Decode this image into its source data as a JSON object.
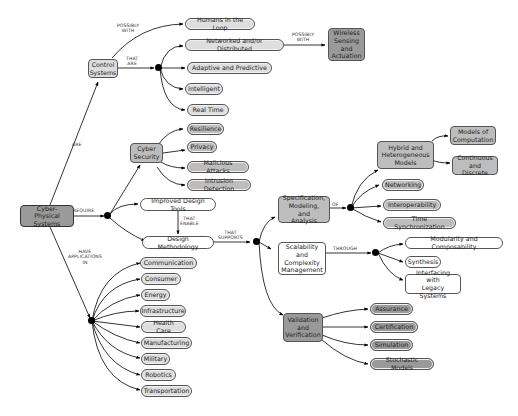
{
  "diagram": {
    "type": "concept-map",
    "root": {
      "label": "Cyber-Physical\nSystems"
    },
    "link_labels": {
      "are": "ARE",
      "require": "REQUIRE",
      "have_applications_in": "HAVE\nAPPLICATIONS\nIN",
      "possibly_with_1": "POSSIBLY\nWITH",
      "that_are": "THAT\nARE",
      "possibly_with_2": "POSSIBLY\nWITH",
      "that_enable": "THAT\nENABLE",
      "that_supports": "THAT\nSUPPORTS",
      "of": "OF",
      "through": "THROUGH"
    },
    "nodes": {
      "control_systems": "Control\nSystems",
      "humans_in_loop": "Humans in the Loop",
      "networked": "Networked and/or Distributed",
      "adaptive": "Adaptive and Predictive",
      "intelligent": "Intelligent",
      "real_time": "Real Time",
      "wireless": "Wireless\nSensing\nand\nActuation",
      "cyber_security": "Cyber\nSecurity",
      "resilience": "Resilience",
      "privacy": "Privacy",
      "malicious": "Malicious Attacks",
      "intrusion": "Intrusion Detection",
      "improved_tools": "Improved Design Tools",
      "design_methodology": "Design Methodology",
      "spec_model": "Specification,\nModeling, and\nAnalysis",
      "hybrid": "Hybrid and\nHeterogeneous\nModels",
      "models_comp": "Models of\nComputation",
      "continuous": "Continuous\nand Discrete",
      "networking": "Networking",
      "interoperability": "Interoperability",
      "time_sync": "Time Synchronization",
      "scalability": "Scalability\nand\nComplexity\nManagement",
      "modularity": "Modularity and Composability",
      "synthesis": "Synthesis",
      "legacy": "Interfacing with\nLegacy Systems",
      "validation": "Validation\nand\nVerification",
      "assurance": "Assurance",
      "certification": "Certification",
      "simulation": "Simulation",
      "stochastic": "Stochastic Models"
    },
    "applications": [
      "Communication",
      "Consumer",
      "Energy",
      "Infrastructure",
      "Health Care",
      "Manufacturing",
      "Military",
      "Robotics",
      "Transportation"
    ],
    "colors": {
      "root_fill": "#9a9a9a",
      "dark_fill": "#9a9a9a",
      "mid_fill": "#bdbdbd",
      "light_fill": "#dedede",
      "white_fill": "#ffffff",
      "edge": "#000000"
    }
  }
}
